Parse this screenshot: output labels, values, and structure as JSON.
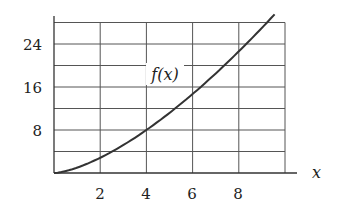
{
  "chart_data": {
    "type": "line",
    "title": "",
    "xlabel": "x",
    "ylabel": "",
    "xlim": [
      0,
      10
    ],
    "ylim": [
      0,
      28
    ],
    "grid": true,
    "x_ticks": [
      2,
      4,
      6,
      8
    ],
    "x_tick_labels": [
      "2",
      "4",
      "6",
      "8"
    ],
    "y_ticks": [
      8,
      16,
      24
    ],
    "y_tick_labels": [
      "8",
      "16",
      "24"
    ],
    "grid_x_step": 2,
    "grid_y_step": 4,
    "series": [
      {
        "name": "f(x)",
        "label": "f(x)",
        "x": [
          0,
          1,
          2,
          3,
          4,
          5,
          6,
          7,
          8,
          9,
          9.55
        ],
        "y": [
          0,
          1.0,
          2.8,
          5.2,
          8.0,
          11.2,
          14.7,
          18.5,
          22.6,
          27.0,
          29.5
        ]
      }
    ],
    "annotations": [
      {
        "text": "f(x)",
        "x": 4.8,
        "y": 18
      }
    ],
    "legend": "none"
  },
  "labels": {
    "curve_label": "f(x)",
    "x_axis_label": "x",
    "x_ticks": [
      "2",
      "4",
      "6",
      "8"
    ],
    "y_ticks": [
      "8",
      "16",
      "24"
    ]
  }
}
